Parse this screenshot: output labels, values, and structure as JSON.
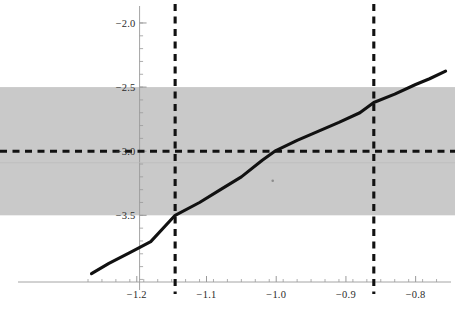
{
  "chart_data": {
    "type": "line",
    "title": "",
    "xlabel": "",
    "ylabel": "",
    "xlim": [
      -1.27,
      -0.755
    ],
    "ylim": [
      -4.02,
      -1.93
    ],
    "grid": false,
    "legend": null,
    "x_ticks": [
      -1.2,
      -1.1,
      -1.0,
      -0.9,
      -0.8
    ],
    "x_tick_labels": [
      "-1.2",
      "-1.1",
      "-1.0",
      "-0.9",
      "-0.8"
    ],
    "y_ticks": [
      -2.0,
      -2.5,
      -3.0,
      -3.5
    ],
    "y_tick_labels": [
      "-2.0",
      "-2.5",
      "-3.0",
      "-3.5"
    ],
    "x_minor_tick_step": 0.02,
    "y_minor_tick_step": 0.1,
    "series": [
      {
        "name": "curve",
        "style": "solid",
        "color": "#111111",
        "width": 3.1,
        "x": [
          -1.265,
          -1.24,
          -1.21,
          -1.18,
          -1.145,
          -1.11,
          -1.08,
          -1.05,
          -1.02,
          -1.002,
          -0.97,
          -0.94,
          -0.91,
          -0.88,
          -0.86,
          -0.83,
          -0.8,
          -0.78,
          -0.757
        ],
        "y": [
          -3.955,
          -3.875,
          -3.79,
          -3.705,
          -3.5,
          -3.4,
          -3.3,
          -3.2,
          -3.07,
          -3.0,
          -2.915,
          -2.845,
          -2.775,
          -2.7,
          -2.62,
          -2.555,
          -2.48,
          -2.435,
          -2.375
        ]
      }
    ],
    "shaded_band": {
      "name": "confidence-band",
      "orientation": "horizontal",
      "y_lower": -3.5,
      "y_upper": -2.5,
      "color": "#c9c9c9",
      "opacity": 1
    },
    "reference_lines": [
      {
        "name": "horizontal-threshold",
        "orientation": "horizontal",
        "value": -3.0,
        "style": "dashed",
        "color": "#111111",
        "width": 3.1
      },
      {
        "name": "vertical-left-bound",
        "orientation": "vertical",
        "value": -1.145,
        "style": "dashed",
        "color": "#111111",
        "width": 3.1
      },
      {
        "name": "vertical-right-bound",
        "orientation": "vertical",
        "value": -0.86,
        "style": "dashed",
        "color": "#111111",
        "width": 3.1
      }
    ],
    "axes": {
      "x_axis_line_y": -4.02,
      "y_axis_line_x": -1.196,
      "axis_color": "#9a9a9a"
    },
    "annotations": [
      {
        "name": "stray-mark",
        "x": -1.005,
        "y": -3.23,
        "text": "."
      }
    ]
  },
  "colors": {
    "background": "#ffffff",
    "band": "#c9c9c9",
    "curve": "#111111",
    "axis": "#9a9a9a",
    "tick_text": "#2b2b2b"
  }
}
